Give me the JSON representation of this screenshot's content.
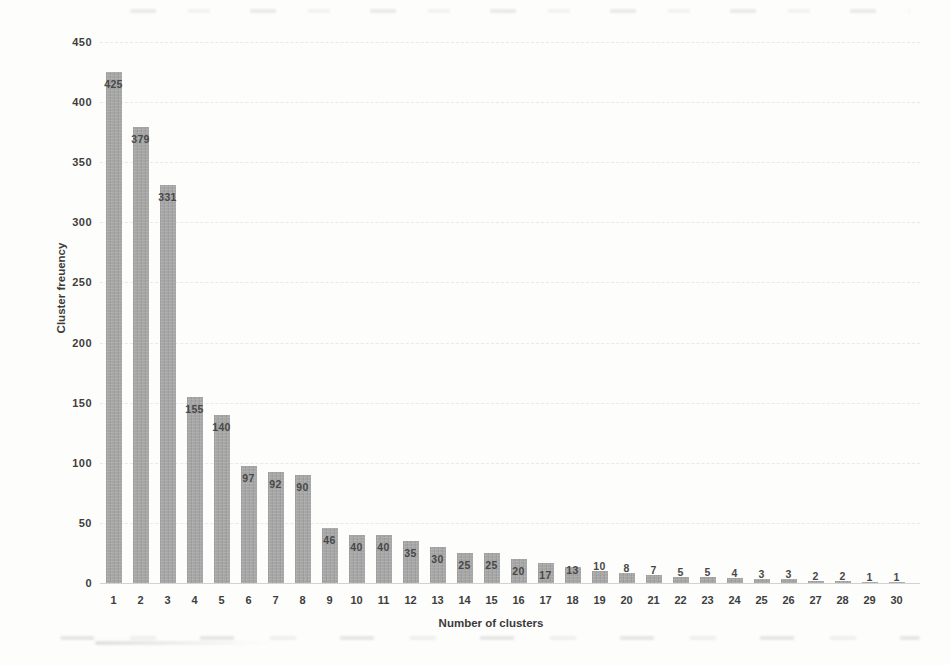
{
  "chart_data": {
    "type": "bar",
    "title": "",
    "xlabel": "Number of clusters",
    "ylabel": "Cluster freuency",
    "categories": [
      "1",
      "2",
      "3",
      "4",
      "5",
      "6",
      "7",
      "8",
      "9",
      "10",
      "11",
      "12",
      "13",
      "14",
      "15",
      "16",
      "17",
      "18",
      "19",
      "20",
      "21",
      "22",
      "23",
      "24",
      "25",
      "26",
      "27",
      "28",
      "29",
      "30"
    ],
    "values": [
      425,
      379,
      331,
      155,
      140,
      97,
      92,
      90,
      46,
      40,
      40,
      35,
      30,
      25,
      25,
      20,
      17,
      13,
      10,
      8,
      7,
      5,
      5,
      4,
      3,
      3,
      2,
      2,
      1,
      1
    ],
    "data_labels_shown": true,
    "ylim": [
      0,
      450
    ],
    "ytick_step": 50,
    "y_ticks": [
      0,
      50,
      100,
      150,
      200,
      250,
      300,
      350,
      400,
      450
    ],
    "grid": "horizontal-faint",
    "legend_position": "none",
    "bar_color": "#a5a5a5",
    "value_label_color": "#484848",
    "tick_label_color": "#3e3e3e",
    "axis_title_color": "#3a3a3a",
    "background_color": "#fdfdfc"
  }
}
